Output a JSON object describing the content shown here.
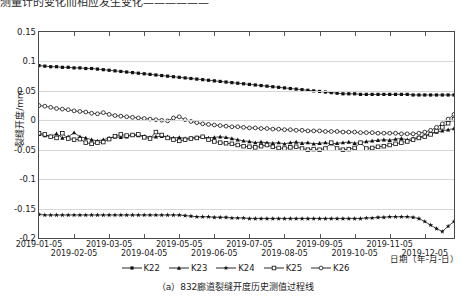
{
  "page": {
    "top_text_clipped": "测量计的变化而相应发生变化——————",
    "caption": "（a）832廊道裂缝开度历史测值过程线"
  },
  "chart_data": {
    "type": "line",
    "title": "",
    "xlabel": "日期（年-月-日）",
    "ylabel": "裂缝开度/mm",
    "ylim": [
      -0.2,
      0.15
    ],
    "yticks": [
      0.15,
      0.1,
      0.05,
      0,
      -0.05,
      -0.1,
      -0.15,
      -0.2
    ],
    "ytick_labels": [
      "0.15",
      "0.1",
      "0.05",
      "0",
      "-0.05",
      "-0.1",
      "-0.15",
      "-0.2"
    ],
    "grid": true,
    "legend_position": "bottom",
    "xtick_labels": [
      "2019-01-05",
      "2019-02-05",
      "2019-03-05",
      "2019-04-05",
      "2019-05-05",
      "2019-06-05",
      "2019-07-05",
      "2019-08-05",
      "2019-09-05",
      "2019-10-05",
      "2019-11-05",
      "2019-12-05"
    ],
    "x_start": "2019-01-05",
    "x_end": "2019-12-25",
    "n_points": 72,
    "series": [
      {
        "name": "K22",
        "marker": "filled-square",
        "color": "#111111",
        "values": [
          0.093,
          0.092,
          0.091,
          0.091,
          0.09,
          0.09,
          0.089,
          0.089,
          0.088,
          0.088,
          0.087,
          0.086,
          0.085,
          0.084,
          0.083,
          0.082,
          0.081,
          0.08,
          0.079,
          0.078,
          0.077,
          0.076,
          0.075,
          0.074,
          0.073,
          0.072,
          0.071,
          0.07,
          0.069,
          0.068,
          0.067,
          0.066,
          0.065,
          0.064,
          0.063,
          0.062,
          0.061,
          0.06,
          0.059,
          0.058,
          0.057,
          0.056,
          0.055,
          0.054,
          0.053,
          0.052,
          0.051,
          0.05,
          0.049,
          0.048,
          0.047,
          0.046,
          0.045,
          0.045,
          0.045,
          0.044,
          0.044,
          0.044,
          0.044,
          0.044,
          0.044,
          0.044,
          0.044,
          0.044,
          0.043,
          0.043,
          0.043,
          0.043,
          0.043,
          0.043,
          0.043,
          0.043
        ]
      },
      {
        "name": "K23",
        "marker": "filled-triangle",
        "color": "#111111",
        "values": [
          -0.024,
          -0.026,
          -0.027,
          -0.023,
          -0.03,
          -0.028,
          -0.021,
          -0.028,
          -0.03,
          -0.033,
          -0.035,
          -0.033,
          -0.03,
          -0.028,
          -0.029,
          -0.028,
          -0.025,
          -0.026,
          -0.027,
          -0.029,
          -0.028,
          -0.027,
          -0.028,
          -0.03,
          -0.029,
          -0.031,
          -0.03,
          -0.029,
          -0.028,
          -0.03,
          -0.029,
          -0.028,
          -0.029,
          -0.031,
          -0.033,
          -0.035,
          -0.036,
          -0.038,
          -0.037,
          -0.038,
          -0.039,
          -0.038,
          -0.04,
          -0.038,
          -0.037,
          -0.039,
          -0.038,
          -0.04,
          -0.039,
          -0.038,
          -0.04,
          -0.039,
          -0.038,
          -0.037,
          -0.039,
          -0.038,
          -0.036,
          -0.035,
          -0.034,
          -0.033,
          -0.034,
          -0.032,
          -0.031,
          -0.033,
          -0.031,
          -0.029,
          -0.026,
          -0.023,
          -0.02,
          -0.018,
          -0.016,
          -0.014
        ]
      },
      {
        "name": "K24",
        "marker": "filled-star",
        "color": "#111111",
        "values": [
          -0.16,
          -0.161,
          -0.161,
          -0.161,
          -0.161,
          -0.161,
          -0.161,
          -0.161,
          -0.161,
          -0.161,
          -0.161,
          -0.161,
          -0.161,
          -0.161,
          -0.161,
          -0.161,
          -0.161,
          -0.161,
          -0.161,
          -0.161,
          -0.161,
          -0.161,
          -0.161,
          -0.161,
          -0.161,
          -0.162,
          -0.163,
          -0.164,
          -0.164,
          -0.164,
          -0.165,
          -0.165,
          -0.165,
          -0.166,
          -0.166,
          -0.166,
          -0.167,
          -0.167,
          -0.167,
          -0.167,
          -0.167,
          -0.167,
          -0.167,
          -0.167,
          -0.167,
          -0.167,
          -0.167,
          -0.167,
          -0.167,
          -0.167,
          -0.167,
          -0.167,
          -0.167,
          -0.167,
          -0.167,
          -0.167,
          -0.166,
          -0.166,
          -0.165,
          -0.165,
          -0.164,
          -0.164,
          -0.164,
          -0.164,
          -0.165,
          -0.167,
          -0.172,
          -0.178,
          -0.184,
          -0.189,
          -0.18,
          -0.172
        ]
      },
      {
        "name": "K25",
        "marker": "open-square",
        "color": "#111111",
        "values": [
          -0.022,
          -0.024,
          -0.028,
          -0.03,
          -0.022,
          -0.031,
          -0.033,
          -0.032,
          -0.038,
          -0.04,
          -0.038,
          -0.037,
          -0.032,
          -0.027,
          -0.024,
          -0.026,
          -0.025,
          -0.024,
          -0.029,
          -0.031,
          -0.02,
          -0.025,
          -0.03,
          -0.033,
          -0.035,
          -0.033,
          -0.031,
          -0.03,
          -0.028,
          -0.033,
          -0.036,
          -0.038,
          -0.039,
          -0.04,
          -0.042,
          -0.044,
          -0.045,
          -0.046,
          -0.044,
          -0.042,
          -0.045,
          -0.047,
          -0.048,
          -0.046,
          -0.045,
          -0.048,
          -0.05,
          -0.049,
          -0.05,
          -0.048,
          -0.038,
          -0.048,
          -0.05,
          -0.049,
          -0.047,
          -0.038,
          -0.048,
          -0.047,
          -0.045,
          -0.044,
          -0.042,
          -0.04,
          -0.038,
          -0.036,
          -0.033,
          -0.03,
          -0.028,
          -0.024,
          -0.018,
          -0.012,
          -0.005,
          0.002
        ]
      },
      {
        "name": "K26",
        "marker": "open-circle",
        "color": "#111111",
        "values": [
          0.025,
          0.024,
          0.022,
          0.02,
          0.019,
          0.018,
          0.016,
          0.015,
          0.014,
          0.012,
          0.011,
          0.013,
          0.01,
          0.008,
          0.007,
          0.006,
          0.005,
          0.004,
          0.003,
          0.002,
          0.001,
          0.0,
          -0.001,
          0.004,
          0.006,
          0.001,
          -0.002,
          -0.004,
          -0.006,
          -0.007,
          -0.008,
          -0.009,
          -0.01,
          -0.011,
          -0.011,
          -0.012,
          -0.013,
          -0.013,
          -0.014,
          -0.014,
          -0.015,
          -0.015,
          -0.016,
          -0.016,
          -0.017,
          -0.017,
          -0.018,
          -0.018,
          -0.018,
          -0.019,
          -0.019,
          -0.019,
          -0.02,
          -0.02,
          -0.02,
          -0.021,
          -0.021,
          -0.021,
          -0.022,
          -0.022,
          -0.022,
          -0.022,
          -0.023,
          -0.023,
          -0.023,
          -0.022,
          -0.02,
          -0.017,
          -0.012,
          -0.006,
          0.002,
          0.01
        ]
      }
    ]
  }
}
